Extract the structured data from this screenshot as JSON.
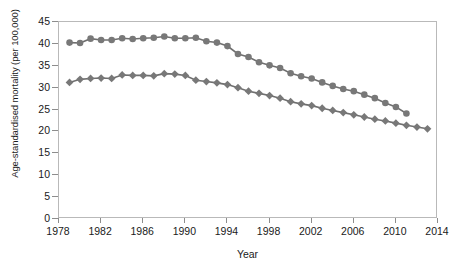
{
  "chart_data": {
    "type": "line",
    "title": "",
    "xlabel": "Year",
    "ylabel": "Age-standardised mortality (per 100,000)",
    "xlim": [
      1978,
      2014
    ],
    "ylim": [
      0,
      45
    ],
    "xticks": [
      1978,
      1982,
      1986,
      1990,
      1994,
      1998,
      2002,
      2006,
      2010,
      2014
    ],
    "yticks": [
      0,
      5,
      10,
      15,
      20,
      25,
      30,
      35,
      40,
      45
    ],
    "grid": false,
    "legend": "none",
    "marker_color": "#787878",
    "line_color": "#6f6f6f",
    "axis_color": "#b9b9b9",
    "series": [
      {
        "name": "upper-series",
        "marker": "circle",
        "x": [
          1979,
          1980,
          1981,
          1982,
          1983,
          1984,
          1985,
          1986,
          1987,
          1988,
          1989,
          1990,
          1991,
          1992,
          1993,
          1994,
          1995,
          1996,
          1997,
          1998,
          1999,
          2000,
          2001,
          2002,
          2003,
          2004,
          2005,
          2006,
          2007,
          2008,
          2009,
          2010,
          2011
        ],
        "values": [
          40.3,
          40.2,
          41.2,
          40.9,
          40.9,
          41.3,
          41.1,
          41.3,
          41.4,
          41.7,
          41.3,
          41.3,
          41.4,
          40.6,
          40.3,
          39.5,
          37.7,
          37.0,
          35.8,
          35.1,
          34.5,
          33.3,
          32.6,
          32.1,
          31.2,
          30.4,
          29.7,
          29.2,
          28.4,
          27.6,
          26.5,
          25.6,
          24.1
        ]
      },
      {
        "name": "lower-series",
        "marker": "diamond",
        "x": [
          1979,
          1980,
          1981,
          1982,
          1983,
          1984,
          1985,
          1986,
          1987,
          1988,
          1989,
          1990,
          1991,
          1992,
          1993,
          1994,
          1995,
          1996,
          1997,
          1998,
          1999,
          2000,
          2001,
          2002,
          2003,
          2004,
          2005,
          2006,
          2007,
          2008,
          2009,
          2010,
          2011,
          2012,
          2013
        ],
        "values": [
          31.2,
          31.9,
          32.1,
          32.2,
          32.1,
          32.9,
          32.8,
          32.8,
          32.7,
          33.2,
          33.1,
          32.8,
          31.7,
          31.4,
          31.1,
          30.7,
          30.0,
          29.2,
          28.7,
          28.2,
          27.6,
          26.8,
          26.3,
          25.9,
          25.3,
          24.8,
          24.3,
          23.8,
          23.3,
          22.8,
          22.4,
          21.9,
          21.4,
          21.0,
          20.6
        ]
      }
    ]
  }
}
